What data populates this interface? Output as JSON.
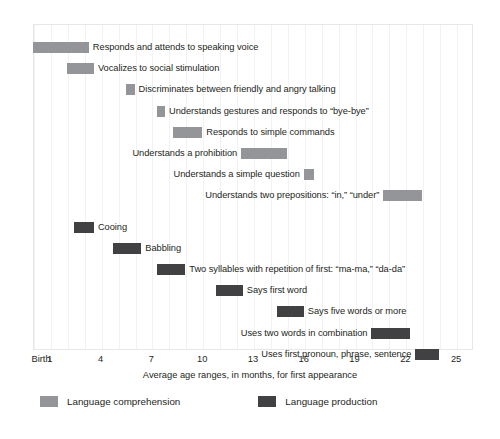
{
  "chart_data": {
    "type": "bar",
    "orientation": "horizontal-range",
    "title": "",
    "xlabel": "Average age ranges, in months, for first appearance",
    "ylabel": "",
    "xlim": [
      0,
      26
    ],
    "grid": true,
    "legend_position": "bottom-left",
    "tick_labels": [
      "Birth",
      "1",
      "4",
      "7",
      "10",
      "13",
      "16",
      "19",
      "22",
      "25"
    ],
    "tick_values": [
      0,
      1,
      4,
      7,
      10,
      13,
      16,
      19,
      22,
      25
    ],
    "legend": [
      {
        "name": "Language comprehension",
        "color": "#939598"
      },
      {
        "name": "Language production",
        "color": "#414042"
      }
    ],
    "series": [
      {
        "name": "Language comprehension",
        "color": "#939598",
        "items": [
          {
            "label": "Responds and attends to speaking voice",
            "start": 0.0,
            "end": 3.3,
            "label_side": "right"
          },
          {
            "label": "Vocalizes to social stimulation",
            "start": 2.0,
            "end": 3.6,
            "label_side": "right"
          },
          {
            "label": "Discriminates between friendly and angry talking",
            "start": 5.5,
            "end": 6.0,
            "label_side": "right"
          },
          {
            "label": "Understands gestures and responds to “bye-bye”",
            "start": 7.3,
            "end": 7.8,
            "label_side": "right"
          },
          {
            "label": "Responds to simple commands",
            "start": 8.3,
            "end": 10.0,
            "label_side": "right"
          },
          {
            "label": "Understands a prohibition",
            "start": 12.3,
            "end": 15.0,
            "label_side": "left"
          },
          {
            "label": "Understands a simple question",
            "start": 16.0,
            "end": 16.6,
            "label_side": "left"
          },
          {
            "label": "Understands two prepositions: “in,” “under”",
            "start": 20.7,
            "end": 23.0,
            "label_side": "left"
          }
        ]
      },
      {
        "name": "Language production",
        "color": "#414042",
        "items": [
          {
            "label": "Cooing",
            "start": 2.4,
            "end": 3.6,
            "label_side": "right"
          },
          {
            "label": "Babbling",
            "start": 4.7,
            "end": 6.4,
            "label_side": "right"
          },
          {
            "label": "Two syllables with repetition of first: “ma-ma,” “da-da”",
            "start": 7.3,
            "end": 9.0,
            "label_side": "right"
          },
          {
            "label": "Says first word",
            "start": 10.8,
            "end": 12.4,
            "label_side": "right"
          },
          {
            "label": "Says five words or more",
            "start": 14.4,
            "end": 16.0,
            "label_side": "right"
          },
          {
            "label": "Uses two words in combination",
            "start": 20.0,
            "end": 22.3,
            "label_side": "left"
          },
          {
            "label": "Uses first pronoun, phrase, sentence",
            "start": 22.6,
            "end": 24.0,
            "label_side": "left"
          }
        ]
      }
    ]
  }
}
